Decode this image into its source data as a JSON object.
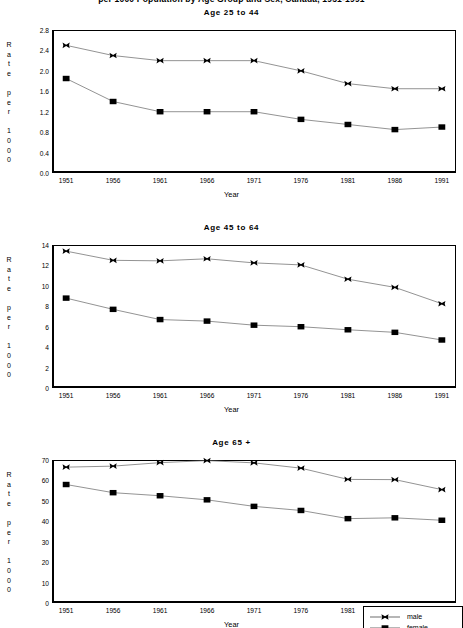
{
  "figure": {
    "super_title": "per 1000 Population by Age Group and Sex, Canada, 1951-1991",
    "xlabel": "Year",
    "ylabel_letters": "R\na\nt\ne\n\np\ne\nr\n\n1\n0\n0\n0",
    "years": [
      "1951",
      "1956",
      "1961",
      "1966",
      "1971",
      "1976",
      "1981",
      "1986",
      "1991"
    ],
    "line_color": "#6f6f6f",
    "marker_color": "#000000",
    "axis_color": "#000000"
  },
  "legend": {
    "entries": [
      {
        "label": "male",
        "marker": "x-marker-icon"
      },
      {
        "label": "female",
        "marker": "square-marker-icon"
      }
    ]
  },
  "chart_data": [
    {
      "type": "line",
      "title": "Age 25 to 44",
      "xlabel": "Year",
      "ylabel": "Rate per 1000",
      "categories": [
        "1951",
        "1956",
        "1961",
        "1966",
        "1971",
        "1976",
        "1981",
        "1986",
        "1991"
      ],
      "x": [
        1951,
        1956,
        1961,
        1966,
        1971,
        1976,
        1981,
        1986,
        1991
      ],
      "ylim": [
        0.0,
        2.8
      ],
      "yticks": [
        "0.0",
        "0.4",
        "0.8",
        "1.2",
        "1.6",
        "2.0",
        "2.4",
        "2.8"
      ],
      "ytick_values": [
        0.0,
        0.4,
        0.8,
        1.2,
        1.6,
        2.0,
        2.4,
        2.8
      ],
      "grid": false,
      "legend_position": "figure bottom-right",
      "series": [
        {
          "name": "male",
          "values": [
            2.5,
            2.3,
            2.2,
            2.2,
            2.2,
            2.0,
            1.75,
            1.65,
            1.65
          ]
        },
        {
          "name": "female",
          "values": [
            1.85,
            1.4,
            1.2,
            1.2,
            1.2,
            1.05,
            0.95,
            0.85,
            0.9
          ]
        }
      ]
    },
    {
      "type": "line",
      "title": "Age 45 to 64",
      "xlabel": "Year",
      "ylabel": "Rate per 1000",
      "categories": [
        "1951",
        "1956",
        "1961",
        "1966",
        "1971",
        "1976",
        "1981",
        "1986",
        "1991"
      ],
      "x": [
        1951,
        1956,
        1961,
        1966,
        1971,
        1976,
        1981,
        1986,
        1991
      ],
      "ylim": [
        0,
        14
      ],
      "yticks": [
        "0",
        "2",
        "4",
        "6",
        "8",
        "10",
        "12",
        "14"
      ],
      "ytick_values": [
        0,
        2,
        4,
        6,
        8,
        10,
        12,
        14
      ],
      "grid": false,
      "legend_position": "figure bottom-right",
      "series": [
        {
          "name": "male",
          "values": [
            13.4,
            12.5,
            12.45,
            12.65,
            12.25,
            12.05,
            10.65,
            9.85,
            8.25
          ]
        },
        {
          "name": "female",
          "values": [
            8.8,
            7.7,
            6.7,
            6.55,
            6.15,
            6.0,
            5.7,
            5.45,
            4.7
          ]
        }
      ]
    },
    {
      "type": "line",
      "title": "Age 65 +",
      "xlabel": "Year",
      "ylabel": "Rate per 1000",
      "categories": [
        "1951",
        "1956",
        "1961",
        "1966",
        "1971",
        "1976",
        "1981",
        "1986",
        "1991"
      ],
      "x": [
        1951,
        1956,
        1961,
        1966,
        1971,
        1976,
        1981,
        1986,
        1991
      ],
      "ylim": [
        0,
        70
      ],
      "yticks": [
        "0",
        "10",
        "20",
        "30",
        "40",
        "50",
        "60",
        "70"
      ],
      "ytick_values": [
        0,
        10,
        20,
        30,
        40,
        50,
        60,
        70
      ],
      "grid": false,
      "legend_position": "figure bottom-right",
      "series": [
        {
          "name": "male",
          "values": [
            66.5,
            67.0,
            68.7,
            69.7,
            68.6,
            66.0,
            60.5,
            60.4,
            55.5
          ]
        },
        {
          "name": "female",
          "values": [
            58.0,
            54.0,
            52.5,
            50.5,
            47.3,
            45.3,
            41.3,
            41.7,
            40.5
          ]
        }
      ]
    }
  ]
}
